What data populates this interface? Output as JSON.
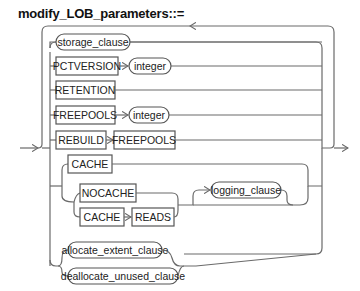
{
  "title": "modify_LOB_parameters::=",
  "nodes": {
    "storage_clause": "storage_clause",
    "pctversion": "PCTVERSION",
    "pctversion_integer": "integer",
    "retention": "RETENTION",
    "freepools": "FREEPOOLS",
    "freepools_integer": "integer",
    "rebuild": "REBUILD",
    "rebuild_freepools": "FREEPOOLS",
    "cache": "CACHE",
    "nocache": "NOCACHE",
    "cache_reads_cache": "CACHE",
    "reads": "READS",
    "logging_clause": "logging_clause",
    "allocate_extent_clause": "allocate_extent_clause",
    "deallocate_unused_clause": "deallocate_unused_clause"
  },
  "node_types": {
    "keywords": [
      "PCTVERSION",
      "RETENTION",
      "FREEPOOLS",
      "REBUILD",
      "CACHE",
      "NOCACHE",
      "READS"
    ],
    "nonterminals": [
      "storage_clause",
      "integer",
      "logging_clause",
      "allocate_extent_clause",
      "deallocate_unused_clause"
    ]
  }
}
